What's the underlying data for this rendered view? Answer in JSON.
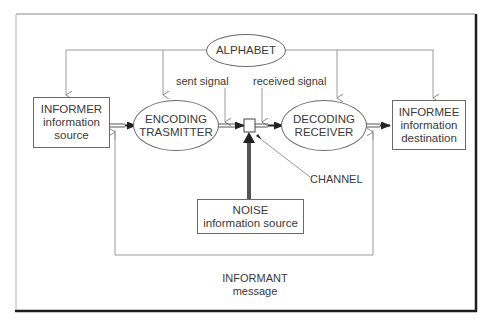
{
  "diagram": {
    "nodes": {
      "alphabet": {
        "line1": "ALPHABET"
      },
      "informer": {
        "line1": "INFORMER",
        "line2": "information",
        "line3": "source"
      },
      "encoding": {
        "line1": "ENCODING",
        "line2": "TRASMITTER"
      },
      "decoding": {
        "line1": "DECODING",
        "line2": "RECEIVER"
      },
      "informee": {
        "line1": "INFORMEE",
        "line2": "information",
        "line3": "destination"
      },
      "noise": {
        "line1": "NOISE",
        "line2": "information source"
      }
    },
    "labels": {
      "sent_signal": "sent signal",
      "received_signal": "received signal",
      "channel": "CHANNEL",
      "informant": "INFORMANT",
      "message": "message"
    },
    "edges": [
      {
        "from": "alphabet",
        "to": "informer",
        "style": "dotted"
      },
      {
        "from": "alphabet",
        "to": "encoding",
        "style": "dotted"
      },
      {
        "from": "alphabet",
        "to": "decoding",
        "style": "dotted"
      },
      {
        "from": "alphabet",
        "to": "informee",
        "style": "dotted"
      },
      {
        "from": "informer",
        "to": "encoding",
        "style": "double"
      },
      {
        "from": "encoding",
        "to": "channel",
        "style": "double"
      },
      {
        "from": "channel",
        "to": "decoding",
        "style": "double"
      },
      {
        "from": "decoding",
        "to": "informee",
        "style": "double"
      },
      {
        "from": "noise",
        "to": "channel",
        "style": "thick"
      },
      {
        "from": "informant",
        "to": "informer-encoding-link",
        "style": "dotted"
      },
      {
        "from": "informant",
        "to": "decoding-informee-link",
        "style": "dotted"
      }
    ],
    "colors": {
      "line": "#6a6a6a",
      "dotted": "#9a9a9a",
      "arrow": "#222222",
      "frame_shadow": "#1e1e1e"
    }
  }
}
